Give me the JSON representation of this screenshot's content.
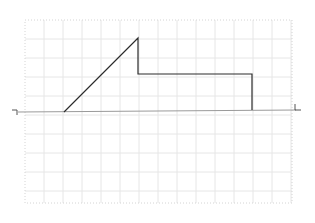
{
  "diagram": {
    "type": "waveform-sketch",
    "background": "#ffffff",
    "grid": {
      "x0": 25,
      "y0": 20,
      "x1": 292,
      "y1": 203,
      "cell": 19,
      "color": "#e6e6e6",
      "border_color": "#d4d4d4",
      "border_style": "dotted"
    },
    "baseline": {
      "x1": 18,
      "y1": 112,
      "x2": 296,
      "y2": 110,
      "color": "#9a9a9a",
      "width": 1
    },
    "endpoint_markers": [
      {
        "name": "left-bracket-marker",
        "points": [
          [
            12,
            110
          ],
          [
            17,
            110
          ],
          [
            17,
            115
          ]
        ],
        "color": "#555555"
      },
      {
        "name": "right-bracket-marker",
        "points": [
          [
            295,
            104
          ],
          [
            295,
            110
          ],
          [
            301,
            110
          ]
        ],
        "color": "#555555"
      }
    ],
    "waveform": {
      "color": "#2b2b2b",
      "width": 1.2,
      "points": [
        [
          64,
          112
        ],
        [
          138,
          38
        ],
        [
          138,
          74
        ],
        [
          252,
          74
        ],
        [
          252,
          110
        ]
      ]
    }
  }
}
